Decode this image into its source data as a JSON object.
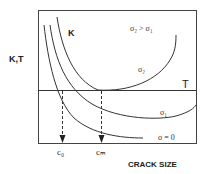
{
  "diagram": {
    "y_axis_label": "K,T",
    "x_axis_label": "CRACK SIZE",
    "curve_family_label": "K",
    "threshold_label": "T",
    "condition_label": "σ₂ > σ₁",
    "curves": [
      {
        "id": "sigma2",
        "label": "σ₂"
      },
      {
        "id": "sigma1",
        "label": "σ₁"
      },
      {
        "id": "sigma0",
        "label": "σ = 0"
      }
    ],
    "markers": [
      {
        "id": "c0",
        "label": "c₀"
      },
      {
        "id": "cm",
        "label": "cₘ"
      }
    ],
    "colors": {
      "line": "#333333",
      "background": "#ffffff"
    }
  }
}
